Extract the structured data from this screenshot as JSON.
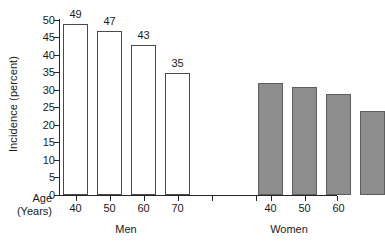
{
  "chart_data": {
    "type": "bar",
    "title": "",
    "xlabel": "Age (Years)",
    "ylabel": "Incidence (percent)",
    "ylim": [
      0,
      50
    ],
    "ytick_values": [
      0,
      5,
      10,
      15,
      20,
      25,
      30,
      35,
      40,
      45,
      50
    ],
    "ytick_labels": [
      "0",
      "5",
      "10",
      "15",
      "20",
      "25",
      "30",
      "35",
      "40",
      "45",
      "50"
    ],
    "grid": false,
    "legend": "none",
    "categories": [
      "40",
      "50",
      "60",
      "70"
    ],
    "groups": [
      {
        "name": "Men",
        "style": "open",
        "fill": "#ffffff",
        "edge": "#4a4a4a",
        "categories": [
          "40",
          "50",
          "60",
          "70"
        ],
        "values": [
          49,
          47,
          43,
          35
        ],
        "value_labels": [
          "49",
          "47",
          "43",
          "35"
        ]
      },
      {
        "name": "Women",
        "style": "filled",
        "fill": "#8d8d8d",
        "edge": "#5e5e5e",
        "categories": [
          "40",
          "50",
          "60",
          "70"
        ],
        "values": [
          32,
          31,
          29,
          24
        ],
        "value_labels": [
          "32",
          "31",
          "29",
          "24"
        ]
      }
    ]
  },
  "axis": {
    "y_title": "Incidence (percent)",
    "x_title_line1": "Age",
    "x_title_line2": "(Years)",
    "y_ticks": [
      "50",
      "45",
      "40",
      "35",
      "30",
      "25",
      "20",
      "15",
      "10",
      "5",
      "0"
    ]
  },
  "men": {
    "group_label": "Men",
    "v0": "49",
    "v1": "47",
    "v2": "43",
    "v3": "35",
    "x0": "40",
    "x1": "50",
    "x2": "60",
    "x3": "70"
  },
  "women": {
    "group_label": "Women",
    "v0": "32",
    "v1": "31",
    "v2": "29",
    "v3": "24",
    "x0": "40",
    "x1": "50",
    "x2": "60",
    "x3": "70"
  },
  "colors": {
    "open_bar_fill": "#ffffff",
    "open_bar_edge": "#4a4a4a",
    "filled_bar_fill": "#8d8d8d",
    "filled_bar_edge": "#5e5e5e",
    "axis": "#262626",
    "text": "#1a1a1a",
    "background": "#ffffff"
  }
}
